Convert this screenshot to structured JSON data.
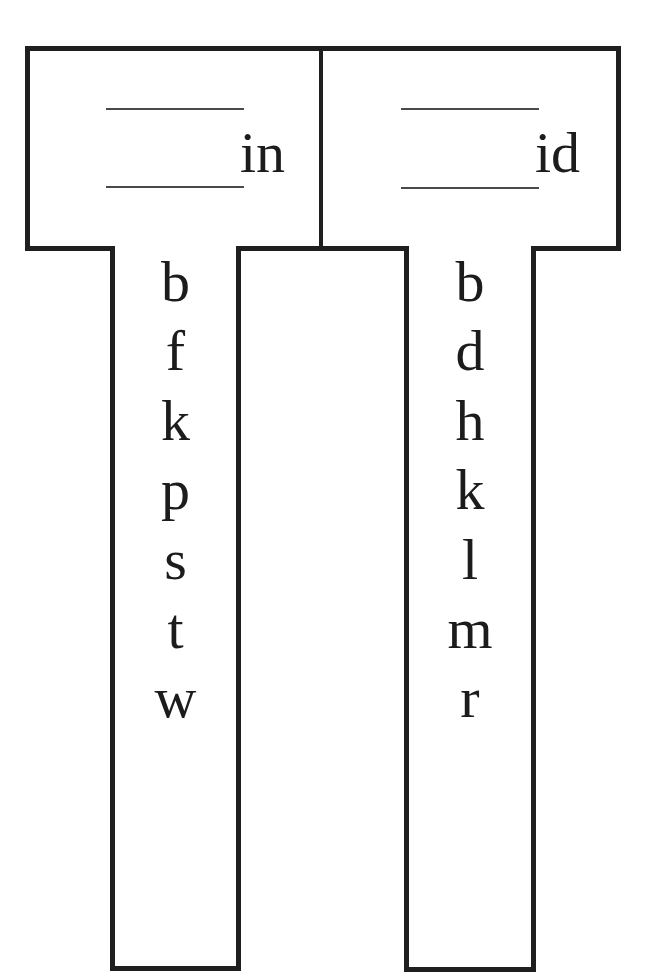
{
  "word_families": [
    {
      "ending": "in",
      "letters": [
        "b",
        "f",
        "k",
        "p",
        "s",
        "t",
        "w"
      ]
    },
    {
      "ending": "id",
      "letters": [
        "b",
        "d",
        "h",
        "k",
        "l",
        "m",
        "r"
      ]
    }
  ],
  "colors": {
    "stroke": "#1f1f1f",
    "blank_line": "#4a4a4a",
    "text": "#1c1c1c",
    "background": "#ffffff"
  }
}
